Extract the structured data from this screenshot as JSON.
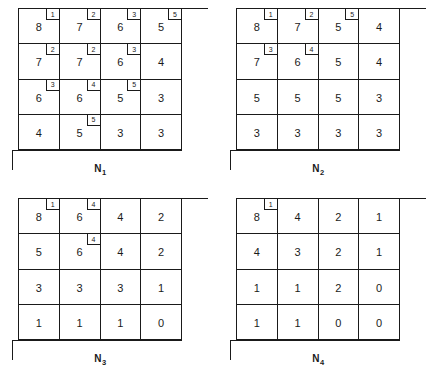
{
  "figure": {
    "panels": [
      {
        "caption_base": "N",
        "caption_sub": "1",
        "rows": [
          [
            {
              "value": "8",
              "corner": "1"
            },
            {
              "value": "7",
              "corner": "2"
            },
            {
              "value": "6",
              "corner": "3"
            },
            {
              "value": "5",
              "corner": "5"
            }
          ],
          [
            {
              "value": "7",
              "corner": "2"
            },
            {
              "value": "7",
              "corner": "2"
            },
            {
              "value": "6",
              "corner": "3"
            },
            {
              "value": "4",
              "corner": null
            }
          ],
          [
            {
              "value": "6",
              "corner": "3"
            },
            {
              "value": "6",
              "corner": "4"
            },
            {
              "value": "5",
              "corner": "5"
            },
            {
              "value": "3",
              "corner": null
            }
          ],
          [
            {
              "value": "4",
              "corner": null
            },
            {
              "value": "5",
              "corner": "5"
            },
            {
              "value": "3",
              "corner": null
            },
            {
              "value": "3",
              "corner": null
            }
          ]
        ]
      },
      {
        "caption_base": "N",
        "caption_sub": "2",
        "rows": [
          [
            {
              "value": "8",
              "corner": "1"
            },
            {
              "value": "7",
              "corner": "2"
            },
            {
              "value": "5",
              "corner": "5"
            },
            {
              "value": "4",
              "corner": null
            }
          ],
          [
            {
              "value": "7",
              "corner": "3"
            },
            {
              "value": "6",
              "corner": "4"
            },
            {
              "value": "5",
              "corner": null
            },
            {
              "value": "4",
              "corner": null
            }
          ],
          [
            {
              "value": "5",
              "corner": null
            },
            {
              "value": "5",
              "corner": null
            },
            {
              "value": "5",
              "corner": null
            },
            {
              "value": "3",
              "corner": null
            }
          ],
          [
            {
              "value": "3",
              "corner": null
            },
            {
              "value": "3",
              "corner": null
            },
            {
              "value": "3",
              "corner": null
            },
            {
              "value": "3",
              "corner": null
            }
          ]
        ]
      },
      {
        "caption_base": "N",
        "caption_sub": "3",
        "rows": [
          [
            {
              "value": "8",
              "corner": "1"
            },
            {
              "value": "6",
              "corner": "4"
            },
            {
              "value": "4",
              "corner": null
            },
            {
              "value": "2",
              "corner": null
            }
          ],
          [
            {
              "value": "5",
              "corner": null
            },
            {
              "value": "6",
              "corner": "4"
            },
            {
              "value": "4",
              "corner": null
            },
            {
              "value": "2",
              "corner": null
            }
          ],
          [
            {
              "value": "3",
              "corner": null
            },
            {
              "value": "3",
              "corner": null
            },
            {
              "value": "3",
              "corner": null
            },
            {
              "value": "1",
              "corner": null
            }
          ],
          [
            {
              "value": "1",
              "corner": null
            },
            {
              "value": "1",
              "corner": null
            },
            {
              "value": "1",
              "corner": null
            },
            {
              "value": "0",
              "corner": null
            }
          ]
        ]
      },
      {
        "caption_base": "N",
        "caption_sub": "4",
        "rows": [
          [
            {
              "value": "8",
              "corner": "1"
            },
            {
              "value": "4",
              "corner": null
            },
            {
              "value": "2",
              "corner": null
            },
            {
              "value": "1",
              "corner": null
            }
          ],
          [
            {
              "value": "4",
              "corner": null
            },
            {
              "value": "3",
              "corner": null
            },
            {
              "value": "2",
              "corner": null
            },
            {
              "value": "1",
              "corner": null
            }
          ],
          [
            {
              "value": "1",
              "corner": null
            },
            {
              "value": "1",
              "corner": null
            },
            {
              "value": "2",
              "corner": null
            },
            {
              "value": "0",
              "corner": null
            }
          ],
          [
            {
              "value": "1",
              "corner": null
            },
            {
              "value": "1",
              "corner": null
            },
            {
              "value": "0",
              "corner": null
            },
            {
              "value": "0",
              "corner": null
            }
          ]
        ]
      }
    ]
  }
}
